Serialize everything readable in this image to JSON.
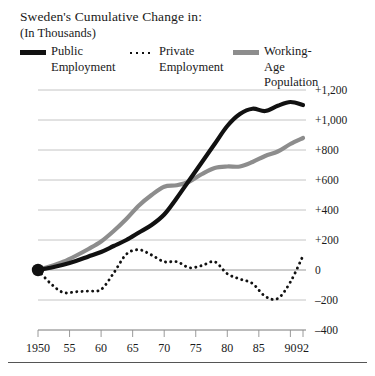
{
  "header": {
    "title": "Sweden's Cumulative Change in:",
    "subtitle": "(In Thousands)"
  },
  "legend": {
    "position": "top",
    "items": [
      {
        "label": "Public\nEmployment",
        "style": "solid",
        "color": "#111111",
        "key": "public-employment"
      },
      {
        "label": "Private\nEmployment",
        "style": "dotted",
        "color": "#111111",
        "key": "private-employment"
      },
      {
        "label": "Working-Age\nPopulation",
        "style": "solid",
        "color": "#8d8d8d",
        "key": "working-age-population"
      }
    ]
  },
  "chart_data": {
    "type": "line",
    "title": "Sweden's Cumulative Change in:",
    "subtitle": "(In Thousands)",
    "xlabel": "",
    "ylabel": "",
    "ylim": [
      -400,
      1200
    ],
    "xlim": [
      1950,
      1992
    ],
    "grid": true,
    "yticks": [
      1200,
      1000,
      800,
      600,
      400,
      200,
      0,
      -200,
      -400
    ],
    "ytick_labels": [
      "+1,200",
      "+1,000",
      "+800",
      "+600",
      "+400",
      "+200",
      "0",
      "–200",
      "–400"
    ],
    "xticks": [
      1950,
      1955,
      1960,
      1965,
      1970,
      1975,
      1980,
      1985,
      1990,
      1992
    ],
    "xtick_labels": [
      "1950",
      "55",
      "60",
      "65",
      "70",
      "75",
      "80",
      "85",
      "90",
      "92"
    ],
    "origin_marker": {
      "x": 1950,
      "y": 0
    },
    "series": [
      {
        "name": "Public Employment",
        "color": "#111111",
        "style": "solid",
        "x": [
          1950,
          1952,
          1954,
          1956,
          1958,
          1960,
          1962,
          1964,
          1966,
          1968,
          1970,
          1972,
          1974,
          1976,
          1978,
          1980,
          1982,
          1984,
          1986,
          1988,
          1990,
          1992
        ],
        "values": [
          0,
          15,
          35,
          60,
          90,
          120,
          160,
          200,
          250,
          300,
          370,
          480,
          600,
          720,
          840,
          960,
          1040,
          1075,
          1060,
          1095,
          1120,
          1100
        ]
      },
      {
        "name": "Private Employment",
        "color": "#111111",
        "style": "dotted",
        "x": [
          1950,
          1952,
          1954,
          1956,
          1958,
          1960,
          1962,
          1964,
          1966,
          1968,
          1970,
          1972,
          1974,
          1976,
          1978,
          1980,
          1982,
          1984,
          1986,
          1988,
          1990,
          1992
        ],
        "values": [
          0,
          -90,
          -150,
          -145,
          -140,
          -130,
          -20,
          105,
          135,
          100,
          55,
          55,
          15,
          30,
          55,
          -25,
          -60,
          -90,
          -175,
          -190,
          -80,
          95
        ]
      },
      {
        "name": "Working-Age Population",
        "color": "#8d8d8d",
        "style": "solid",
        "x": [
          1950,
          1952,
          1954,
          1956,
          1958,
          1960,
          1962,
          1964,
          1966,
          1968,
          1970,
          1972,
          1974,
          1976,
          1978,
          1980,
          1982,
          1984,
          1986,
          1988,
          1990,
          1992
        ],
        "values": [
          0,
          25,
          55,
          95,
          140,
          190,
          260,
          340,
          430,
          500,
          555,
          565,
          590,
          640,
          680,
          690,
          690,
          720,
          760,
          790,
          840,
          880
        ]
      }
    ]
  }
}
